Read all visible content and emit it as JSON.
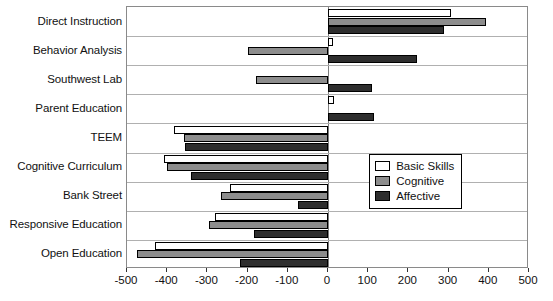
{
  "chart_data": {
    "type": "bar",
    "orientation": "horizontal",
    "title": "",
    "xlabel": "",
    "ylabel": "",
    "xlim": [
      -500,
      500
    ],
    "xticks": [
      -500,
      -400,
      -300,
      -200,
      -100,
      0,
      100,
      200,
      300,
      400,
      500
    ],
    "xtick_labels": [
      "-500",
      "-400",
      "-300",
      "-200",
      "-100",
      "0",
      "100",
      "200",
      "300",
      "400",
      "500"
    ],
    "grid": "horizontal",
    "categories": [
      "Direct Instruction",
      "Behavior Analysis",
      "Southwest Lab",
      "Parent Education",
      "TEEM",
      "Cognitive Curriculum",
      "Bank Street",
      "Responsive Education",
      "Open Education"
    ],
    "series": [
      {
        "name": "Basic Skills",
        "color": "#ffffff",
        "values": [
          305,
          12,
          0,
          15,
          -383,
          -408,
          -245,
          -280,
          -430
        ]
      },
      {
        "name": "Cognitive",
        "color": "#8d8d8d",
        "values": [
          393,
          -200,
          -180,
          0,
          -358,
          -400,
          -265,
          -295,
          -475
        ]
      },
      {
        "name": "Affective",
        "color": "#2e2e2e",
        "values": [
          288,
          222,
          110,
          115,
          -355,
          -340,
          -75,
          -185,
          -219
        ]
      }
    ],
    "legend": {
      "position": "bottom-right",
      "entries": [
        {
          "label": "Basic Skills",
          "swatch": "basic"
        },
        {
          "label": "Cognitive",
          "swatch": "cog"
        },
        {
          "label": "Affective",
          "swatch": "aff"
        }
      ]
    }
  }
}
